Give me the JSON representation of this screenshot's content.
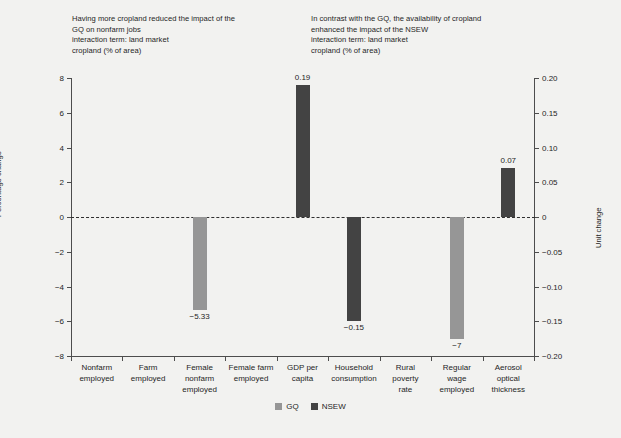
{
  "annotations": {
    "left": "Having more cropland reduced the impact of the\nGQ on nonfarm jobs\ninteraction term: land market\ncropland (% of area)",
    "right": "In contrast with the GQ, the availability of cropland\nenhanced the impact of the NSEW\ninteraction term: land market\ncropland (% of area)"
  },
  "colors": {
    "gq": "#969696",
    "nsew": "#434343",
    "background": "#f2f2f0",
    "axis": "#4d4d4d",
    "text": "#1f1f1f"
  },
  "chart_data": {
    "type": "bar",
    "title": "",
    "xlabel": "",
    "ylabel": "Percentage change",
    "y2label": "Unit change",
    "ylim": [
      -8,
      8
    ],
    "y2lim": [
      -0.2,
      0.2
    ],
    "yticks": [
      "8",
      "6",
      "4",
      "2",
      "0",
      "−2",
      "−4",
      "−6",
      "−8"
    ],
    "ytick_values": [
      8,
      6,
      4,
      2,
      0,
      -2,
      -4,
      -6,
      -8
    ],
    "y2ticks": [
      "0.20",
      "0.15",
      "0.10",
      "0.05",
      "0",
      "−0.05",
      "−0.10",
      "−0.15",
      "−0.20"
    ],
    "y2tick_values": [
      0.2,
      0.15,
      0.1,
      0.05,
      0,
      -0.05,
      -0.1,
      -0.15,
      -0.2
    ],
    "grid": false,
    "zero_line": true,
    "legend_position": "bottom",
    "categories": [
      "Nonfarm\nemployed",
      "Farm\nemployed",
      "Female\nnonfarm\nemployed",
      "Female farm\nemployed",
      "GDP per\ncapita",
      "Household\nconsumption",
      "Rural\npoverty\nrate",
      "Regular\nwage\nemployed",
      "Aerosol\noptical\nthickness"
    ],
    "series": [
      {
        "name": "GQ",
        "axis": "left",
        "color": "#969696",
        "values": [
          null,
          null,
          -5.33,
          null,
          null,
          null,
          null,
          -7,
          null
        ],
        "labels": [
          null,
          null,
          "−5.33",
          null,
          null,
          null,
          null,
          "−7",
          null
        ]
      },
      {
        "name": "NSEW",
        "axis": "right",
        "color": "#434343",
        "values": [
          null,
          null,
          null,
          null,
          0.19,
          -0.15,
          null,
          null,
          0.07
        ],
        "labels": [
          null,
          null,
          null,
          null,
          "0.19",
          "−0.15",
          null,
          null,
          "0.07"
        ]
      }
    ],
    "legend": [
      "GQ",
      "NSEW"
    ]
  }
}
